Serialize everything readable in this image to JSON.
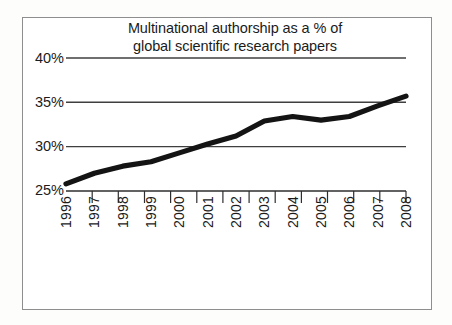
{
  "chart_data": {
    "type": "line",
    "title": "Multinational authorship as a % of\nglobal scientific research papers",
    "title_line1": "Multinational authorship as a % of",
    "title_line2": "global scientific research papers",
    "xlabel": "",
    "ylabel": "",
    "categories": [
      "1996",
      "1997",
      "1998",
      "1999",
      "2000",
      "2001",
      "2002",
      "2003",
      "2004",
      "2005",
      "2006",
      "2007",
      "2008"
    ],
    "values": [
      25.8,
      27.0,
      27.8,
      28.3,
      29.3,
      30.3,
      31.2,
      32.9,
      33.4,
      33.0,
      33.4,
      34.6,
      35.7
    ],
    "series": [
      {
        "name": "Multinational authorship",
        "values": [
          25.8,
          27.0,
          27.8,
          28.3,
          29.3,
          30.3,
          31.2,
          32.9,
          33.4,
          33.0,
          33.4,
          34.6,
          35.7
        ]
      }
    ],
    "ylim": [
      25,
      40
    ],
    "ytick_values": [
      25,
      30,
      35,
      40
    ],
    "ytick_labels": [
      "25%",
      "30%",
      "35%",
      "40%"
    ],
    "grid": true,
    "grid_axis": "y",
    "legend": false,
    "legend_position": "none",
    "line_color": "#141414",
    "grid_color": "#4a4a4a",
    "axis_color": "#3a3a3a",
    "frame_color": "#8e8e8e",
    "background_color": "#ffffff"
  }
}
